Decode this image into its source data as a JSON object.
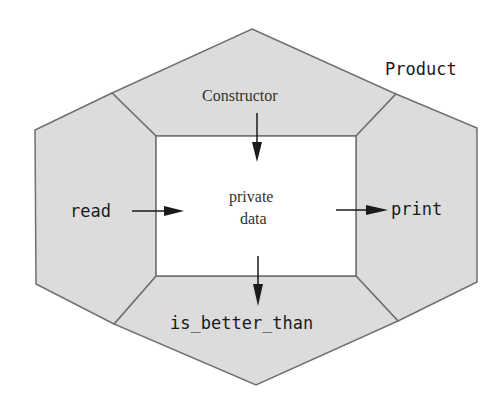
{
  "diagram": {
    "class_name": "Product",
    "core": {
      "line1": "private",
      "line2": "data"
    },
    "members": {
      "top": "Constructor",
      "left": "read",
      "right": "print",
      "bottom": "is_better_than"
    },
    "colors": {
      "segment_fill": "#dcdcdc",
      "core_fill": "#ffffff",
      "stroke": "#707070",
      "arrow": "#1a1a1a"
    }
  }
}
